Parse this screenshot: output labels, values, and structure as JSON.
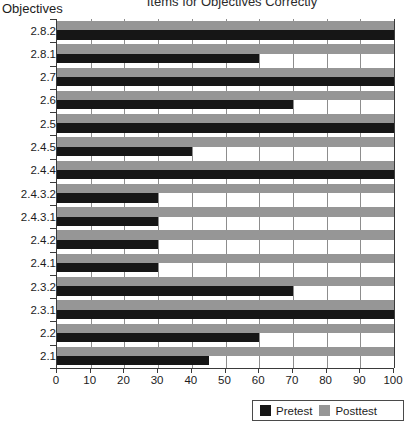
{
  "chart_data": {
    "type": "bar",
    "orientation": "horizontal",
    "title": "Items for Objectives Correctly",
    "ylabel": "Objectives",
    "xlabel": "",
    "xlim": [
      0,
      100
    ],
    "xticks": [
      0,
      10,
      20,
      30,
      40,
      50,
      60,
      70,
      80,
      90,
      100
    ],
    "grid": true,
    "legend_position": "bottom-right",
    "categories": [
      "2.8.2",
      "2.8.1",
      "2.7",
      "2.6",
      "2.5",
      "2.4.5",
      "2.4.4",
      "2.4.3.2",
      "2.4.3.1",
      "2.4.2",
      "2.4.1",
      "2.3.2",
      "2.3.1",
      "2.2",
      "2.1"
    ],
    "category_order_top_to_bottom": [
      "2.8.2",
      "2.8.1",
      "2.7",
      "2.6",
      "2.5",
      "2.4.5",
      "2.4.4",
      "2.4.3.2",
      "2.4.3.1",
      "2.4.2",
      "2.4.1",
      "2.3.2",
      "2.3.1",
      "2.2",
      "2.1"
    ],
    "series": [
      {
        "name": "Pretest",
        "color": "#161616",
        "values": [
          100,
          60,
          100,
          70,
          100,
          40,
          100,
          30,
          30,
          30,
          30,
          70,
          100,
          60,
          45
        ]
      },
      {
        "name": "Posttest",
        "color": "#969696",
        "values": [
          100,
          100,
          100,
          100,
          100,
          100,
          100,
          100,
          100,
          100,
          100,
          100,
          100,
          100,
          100
        ]
      }
    ]
  },
  "legend": {
    "items": [
      {
        "label": "Pretest",
        "color": "#161616"
      },
      {
        "label": "Posttest",
        "color": "#969696"
      }
    ]
  }
}
